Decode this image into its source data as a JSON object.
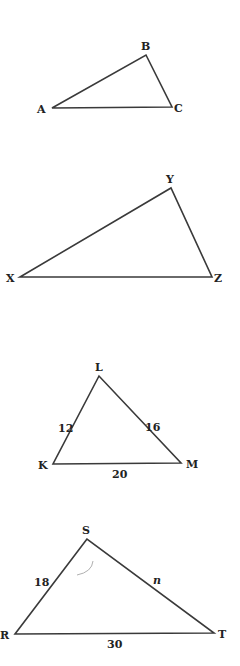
{
  "figure": {
    "triangles": [
      {
        "id": "ABC",
        "vertices": [
          {
            "label": "A",
            "x": 52,
            "y": 108
          },
          {
            "label": "B",
            "x": 146,
            "y": 55
          },
          {
            "label": "C",
            "x": 172,
            "y": 107
          }
        ],
        "side_labels": []
      },
      {
        "id": "XYZ",
        "vertices": [
          {
            "label": "X",
            "x": 20,
            "y": 277
          },
          {
            "label": "Y",
            "x": 171,
            "y": 188
          },
          {
            "label": "Z",
            "x": 212,
            "y": 277
          }
        ],
        "side_labels": []
      },
      {
        "id": "KLM",
        "vertices": [
          {
            "label": "L",
            "x": 99,
            "y": 376
          },
          {
            "label": "K",
            "x": 53,
            "y": 464
          },
          {
            "label": "M",
            "x": 181,
            "y": 463
          }
        ],
        "side_labels": [
          {
            "side": "KL",
            "text": "12"
          },
          {
            "side": "LM",
            "text": "16"
          },
          {
            "side": "KM",
            "text": "20"
          }
        ]
      },
      {
        "id": "RST",
        "vertices": [
          {
            "label": "S",
            "x": 87,
            "y": 539
          },
          {
            "label": "R",
            "x": 15,
            "y": 634
          },
          {
            "label": "T",
            "x": 214,
            "y": 633
          }
        ],
        "side_labels": [
          {
            "side": "RS",
            "text": "18"
          },
          {
            "side": "ST",
            "text": "n"
          },
          {
            "side": "RT",
            "text": "30"
          }
        ]
      }
    ]
  }
}
